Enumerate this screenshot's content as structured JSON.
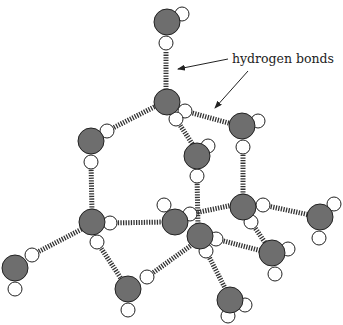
{
  "diagram": {
    "annotation": {
      "text": "hydrogen bonds",
      "x": 232,
      "y": 51
    },
    "colors": {
      "oxygen": "#6e6e6e",
      "hydrogen": "#ffffff",
      "outline": "#222222",
      "bond": "#333333"
    },
    "oxygens": [
      {
        "id": "O1",
        "x": 167,
        "y": 22
      },
      {
        "id": "O2",
        "x": 167,
        "y": 102
      },
      {
        "id": "O3",
        "x": 91,
        "y": 141
      },
      {
        "id": "O4",
        "x": 242,
        "y": 126
      },
      {
        "id": "O5",
        "x": 197,
        "y": 156
      },
      {
        "id": "O6",
        "x": 92,
        "y": 222
      },
      {
        "id": "O7",
        "x": 175,
        "y": 222
      },
      {
        "id": "O8",
        "x": 200,
        "y": 236
      },
      {
        "id": "O9",
        "x": 243,
        "y": 207
      },
      {
        "id": "O10",
        "x": 320,
        "y": 217
      },
      {
        "id": "O11",
        "x": 15,
        "y": 268
      },
      {
        "id": "O12",
        "x": 128,
        "y": 289
      },
      {
        "id": "O13",
        "x": 272,
        "y": 253
      },
      {
        "id": "O14",
        "x": 230,
        "y": 300
      }
    ],
    "hydrogens": [
      {
        "x": 182,
        "y": 14
      },
      {
        "x": 166,
        "y": 43
      },
      {
        "x": 185,
        "y": 111
      },
      {
        "x": 176,
        "y": 119
      },
      {
        "x": 107,
        "y": 131
      },
      {
        "x": 91,
        "y": 162
      },
      {
        "x": 258,
        "y": 121
      },
      {
        "x": 243,
        "y": 147
      },
      {
        "x": 208,
        "y": 146
      },
      {
        "x": 197,
        "y": 176
      },
      {
        "x": 110,
        "y": 223
      },
      {
        "x": 97,
        "y": 242
      },
      {
        "x": 164,
        "y": 205
      },
      {
        "x": 190,
        "y": 214
      },
      {
        "x": 216,
        "y": 239
      },
      {
        "x": 206,
        "y": 251
      },
      {
        "x": 263,
        "y": 205
      },
      {
        "x": 251,
        "y": 222
      },
      {
        "x": 334,
        "y": 204
      },
      {
        "x": 319,
        "y": 238
      },
      {
        "x": 32,
        "y": 255
      },
      {
        "x": 15,
        "y": 289
      },
      {
        "x": 147,
        "y": 277
      },
      {
        "x": 128,
        "y": 310
      },
      {
        "x": 288,
        "y": 249
      },
      {
        "x": 275,
        "y": 274
      },
      {
        "x": 245,
        "y": 305
      },
      {
        "x": 228,
        "y": 316
      }
    ],
    "hbonds": [
      {
        "x1": 166,
        "y1": 52,
        "x2": 166,
        "y2": 92
      },
      {
        "x1": 107,
        "y1": 131,
        "x2": 160,
        "y2": 104
      },
      {
        "x1": 185,
        "y1": 111,
        "x2": 232,
        "y2": 124
      },
      {
        "x1": 176,
        "y1": 119,
        "x2": 195,
        "y2": 148
      },
      {
        "x1": 91,
        "y1": 162,
        "x2": 92,
        "y2": 212
      },
      {
        "x1": 243,
        "y1": 147,
        "x2": 243,
        "y2": 197
      },
      {
        "x1": 197,
        "y1": 176,
        "x2": 198,
        "y2": 226
      },
      {
        "x1": 110,
        "y1": 223,
        "x2": 166,
        "y2": 222
      },
      {
        "x1": 32,
        "y1": 255,
        "x2": 84,
        "y2": 228
      },
      {
        "x1": 97,
        "y1": 242,
        "x2": 122,
        "y2": 280
      },
      {
        "x1": 147,
        "y1": 277,
        "x2": 193,
        "y2": 244
      },
      {
        "x1": 190,
        "y1": 214,
        "x2": 233,
        "y2": 205
      },
      {
        "x1": 263,
        "y1": 205,
        "x2": 310,
        "y2": 215
      },
      {
        "x1": 251,
        "y1": 222,
        "x2": 266,
        "y2": 244
      },
      {
        "x1": 216,
        "y1": 239,
        "x2": 262,
        "y2": 251
      },
      {
        "x1": 206,
        "y1": 251,
        "x2": 226,
        "y2": 290
      }
    ],
    "arrows": [
      {
        "x1": 228,
        "y1": 59,
        "x2": 178,
        "y2": 69
      },
      {
        "x1": 248,
        "y1": 71,
        "x2": 215,
        "y2": 108
      }
    ]
  }
}
